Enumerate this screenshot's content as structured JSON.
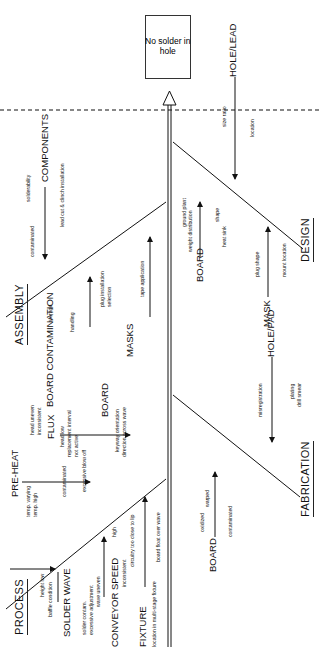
{
  "diagram": {
    "type": "fishbone",
    "orientation": "rotated 90deg counter-clockwise (head at top)",
    "effect": "No solder in hole",
    "effect_lines": [
      "No",
      "solder",
      "in hole"
    ]
  },
  "categories": {
    "process": {
      "label": "PROCESS",
      "groups": [
        {
          "label": "PRE-HEAT",
          "causes": [
            "temp. varying",
            "temp. high"
          ]
        },
        {
          "label": "FLUX",
          "causes": [
            "head uneven",
            "inconsistent",
            "head low",
            "replacement interval",
            "not active",
            "contaminated",
            "excessive blow off"
          ]
        },
        {
          "label": "BOARD",
          "causes": [
            "keyway orientation",
            "direction across wave"
          ]
        },
        {
          "label": "SOLDER WAVE",
          "label_lines": [
            "SOLDER",
            "WAVE"
          ],
          "causes": [
            "height low",
            "baffle condition",
            "solder contam.",
            "excessive adjustment",
            "wave uneven"
          ]
        },
        {
          "label": "CONVEYOR SPEED",
          "label_lines": [
            "CONVEYOR",
            "SPEED"
          ],
          "causes": [
            "high",
            "inconsistent"
          ]
        },
        {
          "label": "FIXTURE",
          "causes": [
            "circuitry too close to lip",
            "board float over wave",
            "location in multi-stage fixture"
          ]
        }
      ]
    },
    "assembly": {
      "label": "ASSEMBLY",
      "groups": [
        {
          "label": "COMPONENTS",
          "causes": [
            "solderability",
            "contaminated",
            "lead cut & clinch installation"
          ]
        },
        {
          "label": "BOARD CONTAMINATION",
          "label_lines": [
            "BOARD",
            "CONTAMINATION"
          ],
          "causes": [
            "storage",
            "handling"
          ]
        },
        {
          "label": "MASKS",
          "causes": [
            "plug installation",
            "selection",
            "tape application"
          ]
        }
      ]
    },
    "design": {
      "label": "DESIGN",
      "groups": [
        {
          "label": "HOLE/LEAD",
          "causes": [
            "size ratio",
            "location"
          ]
        },
        {
          "label": "BOARD",
          "causes": [
            "ground plant",
            "weight distribution",
            "shape",
            "heat sink"
          ]
        },
        {
          "label": "MASK",
          "causes": [
            "plug shape",
            "mount location"
          ]
        }
      ]
    },
    "fabrication": {
      "label": "FABRICATION",
      "groups": [
        {
          "label": "HOLE/PAD",
          "causes": [
            "misregistration",
            "plating",
            "drill smear"
          ]
        },
        {
          "label": "BOARD",
          "causes": [
            "oxidized",
            "warped",
            "contaminated"
          ]
        }
      ]
    }
  }
}
